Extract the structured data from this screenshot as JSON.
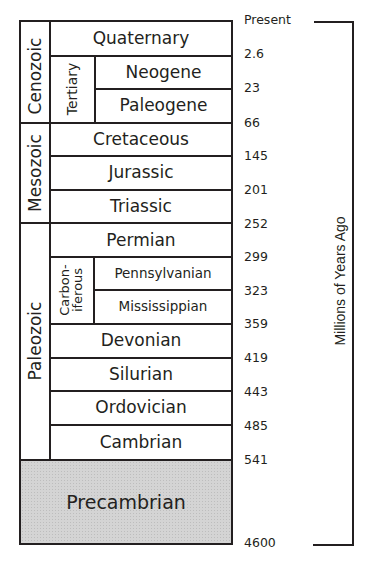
{
  "diagram": {
    "eras": [
      {
        "name": "Cenozoic"
      },
      {
        "name": "Mesozoic"
      },
      {
        "name": "Paleozoic"
      }
    ],
    "subgroups": [
      {
        "name": "Tertiary"
      },
      {
        "name": "Carbon-\niferous",
        "line1": "Carbon-",
        "line2": "iferous"
      }
    ],
    "periods": [
      {
        "name": "Quaternary"
      },
      {
        "name": "Neogene"
      },
      {
        "name": "Paleogene"
      },
      {
        "name": "Cretaceous"
      },
      {
        "name": "Jurassic"
      },
      {
        "name": "Triassic"
      },
      {
        "name": "Permian"
      },
      {
        "name": "Pennsylvanian"
      },
      {
        "name": "Mississippian"
      },
      {
        "name": "Devonian"
      },
      {
        "name": "Silurian"
      },
      {
        "name": "Ordovician"
      },
      {
        "name": "Cambrian"
      },
      {
        "name": "Precambrian"
      }
    ],
    "boundaries": [
      "Present",
      "2.6",
      "23",
      "66",
      "145",
      "201",
      "252",
      "299",
      "323",
      "359",
      "419",
      "443",
      "485",
      "541",
      "4600"
    ],
    "axis_label": "Millions of Years Ago",
    "colors": {
      "line": "#231f20",
      "precambrian_fill": "#d4d4d4"
    }
  }
}
